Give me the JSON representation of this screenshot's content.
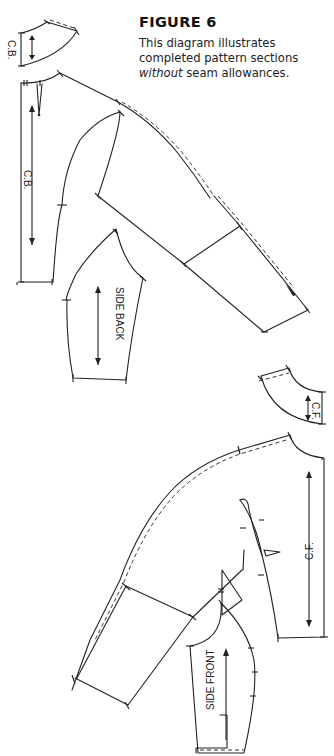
{
  "figure": {
    "title": "FIGURE 6",
    "text_line1": "This diagram illustrates",
    "text_line2": "completed pattern sections",
    "text_italic": "without",
    "text_line3_rest": " seam allowances."
  },
  "labels": {
    "back_collar": "C.B.",
    "center_back": "C.B.",
    "side_back": "SIDE BACK",
    "front_collar": "C.F.",
    "center_front": "C.F.",
    "side_front": "SIDE FRONT"
  },
  "colors": {
    "line": "#222222",
    "background": "#ffffff"
  }
}
